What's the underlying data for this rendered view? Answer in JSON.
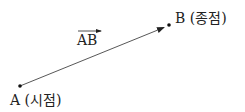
{
  "diagram": {
    "vector_label": "AB",
    "start_point": {
      "name": "A",
      "label": "A (시점)",
      "x": 20,
      "y": 86
    },
    "end_point": {
      "name": "B",
      "label": "B (종점)",
      "x": 169,
      "y": 25
    },
    "line_color": "#333333",
    "text_color": "#222222"
  }
}
